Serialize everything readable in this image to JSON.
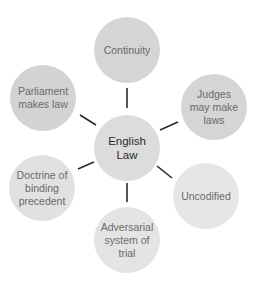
{
  "diagram": {
    "center": {
      "label": "English\nLaw",
      "x": 127,
      "y": 148,
      "r": 33,
      "color": "#dcdcdc"
    },
    "nodes": [
      {
        "id": "continuity",
        "label": "Continuity",
        "x": 127,
        "y": 50,
        "r": 33,
        "color": "#d5d5d5"
      },
      {
        "id": "judges",
        "label": "Judges\nmay make\nlaws",
        "x": 214,
        "y": 107,
        "r": 33,
        "color": "#d5d5d5"
      },
      {
        "id": "uncodified",
        "label": "Uncodified",
        "x": 206,
        "y": 196,
        "r": 33,
        "color": "#e6e6e6"
      },
      {
        "id": "adversarial",
        "label": "Adversarial\nsystem of\ntrial",
        "x": 127,
        "y": 240,
        "r": 33,
        "color": "#e4e4e4"
      },
      {
        "id": "doctrine",
        "label": "Doctrine of\nbinding\nprecedent",
        "x": 42,
        "y": 188,
        "r": 33,
        "color": "#e1e1e1"
      },
      {
        "id": "parliament",
        "label": "Parliament\nmakes law",
        "x": 43,
        "y": 98,
        "r": 33,
        "color": "#d3d3d3"
      }
    ],
    "connector_color": "#2a2a2a"
  }
}
